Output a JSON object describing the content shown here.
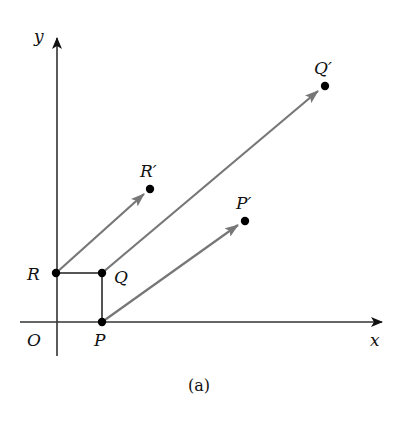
{
  "figure": {
    "caption": "(a)",
    "axes": {
      "x_label": "x",
      "y_label": "y",
      "origin_label": "O"
    },
    "points": {
      "P": {
        "label": "P",
        "x": 102,
        "y": 322
      },
      "Q": {
        "label": "Q",
        "x": 102,
        "y": 273
      },
      "R": {
        "label": "R",
        "x": 56,
        "y": 273
      },
      "P_prime": {
        "label": "P′",
        "x": 245,
        "y": 221
      },
      "Q_prime": {
        "label": "Q′",
        "x": 325,
        "y": 86
      },
      "R_prime": {
        "label": "R′",
        "x": 150,
        "y": 189
      }
    },
    "vectors": [
      {
        "from": "P",
        "to": "P′"
      },
      {
        "from": "Q",
        "to": "Q′"
      },
      {
        "from": "R",
        "to": "R′"
      }
    ],
    "colors": {
      "axis": "#222222",
      "vector": "#777777",
      "point": "#000000"
    }
  }
}
